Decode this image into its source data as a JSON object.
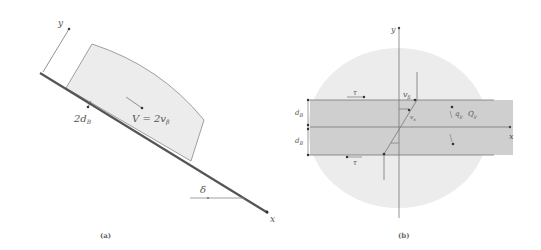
{
  "panel_a": {
    "caption": "(a)",
    "axis_y": "y",
    "axis_x": "x",
    "label_thickness": "2d",
    "label_thickness_sub": "B",
    "label_velocity": "V = 2v",
    "label_velocity_sub": "β",
    "label_angle": "δ"
  },
  "panel_b": {
    "caption": "(b)",
    "axis_y": "y",
    "axis_x": "x",
    "label_tau_top": "τ",
    "label_tau_bottom": "τ",
    "label_d_top": "d",
    "label_d_top_sub": "B",
    "label_d_bottom": "d",
    "label_d_bottom_sub": "B",
    "label_vbeta": "v",
    "label_vbeta_sub": "β",
    "label_vs": "v",
    "label_vs_sub": "s",
    "label_q": "q",
    "label_q_sub": "y",
    "label_Q": "Q",
    "label_Q_sub": "y"
  },
  "colors": {
    "block_fill": "#ececec",
    "band_fill": "#cfcfcf",
    "ellipse_fill": "#ececec",
    "line": "#666666",
    "slope": "#555555"
  }
}
